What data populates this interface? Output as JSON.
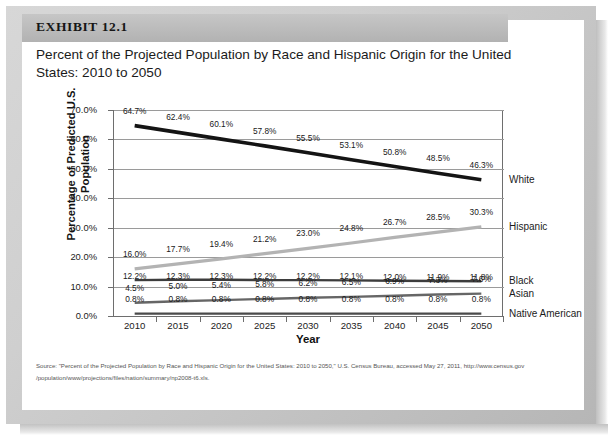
{
  "exhibit": {
    "label": "EXHIBIT 12.1",
    "title": "Percent of the Projected Population by Race and Hispanic Origin for the United States: 2010 to 2050"
  },
  "source": {
    "line1": "Source: \"Percent of the Projected Population by Race and Hispanic Origin for the United States:  2010 to 2050,\" U.S. Census Bureau, accessed May 27, 2011, http://www.census.gov",
    "line2": "/population/www/projections/files/nation/summary/np2008-t6.xls."
  },
  "chart_data": {
    "type": "line",
    "title": "Percent of the Projected Population by Race and Hispanic Origin for the United States: 2010 to 2050",
    "xlabel": "Year",
    "ylabel": "Percentage of Predicted U.S. Population",
    "categories": [
      "2010",
      "2015",
      "2020",
      "2025",
      "2030",
      "2035",
      "2040",
      "2045",
      "2050"
    ],
    "ylim": [
      0,
      70
    ],
    "ytick_labels": [
      "0.0%",
      "10.0%",
      "20.0%",
      "30.0%",
      "40.0%",
      "50.0%",
      "60.0%",
      "70.0%"
    ],
    "ytick_values": [
      0,
      10,
      20,
      30,
      40,
      50,
      60,
      70
    ],
    "grid": "horizontal",
    "legend_position": "right-of-line-ends",
    "series": [
      {
        "name": "White",
        "color": "#141414",
        "values": [
          64.7,
          62.4,
          60.1,
          57.8,
          55.5,
          53.1,
          50.8,
          48.5,
          46.3
        ],
        "labels": [
          "64.7%",
          "62.4%",
          "60.1%",
          "57.8%",
          "55.5%",
          "53.1%",
          "50.8%",
          "48.5%",
          "46.3%"
        ]
      },
      {
        "name": "Hispanic",
        "color": "#b3b3b3",
        "values": [
          16.0,
          17.7,
          19.4,
          21.2,
          23.0,
          24.8,
          26.7,
          28.5,
          30.3
        ],
        "labels": [
          "16.0%",
          "17.7%",
          "19.4%",
          "21.2%",
          "23.0%",
          "24.8%",
          "26.7%",
          "28.5%",
          "30.3%"
        ]
      },
      {
        "name": "Black",
        "color": "#3d3d3d",
        "values": [
          12.2,
          12.3,
          12.3,
          12.2,
          12.2,
          12.1,
          12.0,
          11.9,
          11.8
        ],
        "labels": [
          "12.2%",
          "12.3%",
          "12.3%",
          "12.2%",
          "12.2%",
          "12.1%",
          "12.0%",
          "11.9%",
          "11.8%"
        ]
      },
      {
        "name": "Asian",
        "color": "#666666",
        "values": [
          4.5,
          5.0,
          5.4,
          5.8,
          6.2,
          6.5,
          6.9,
          7.3,
          7.6
        ],
        "labels": [
          "4.5%",
          "5.0%",
          "5.4%",
          "5.8%",
          "6.2%",
          "6.5%",
          "6.9%",
          "7.3%",
          "7.6%"
        ]
      },
      {
        "name": "Native American",
        "color": "#4a4a4a",
        "values": [
          0.8,
          0.8,
          0.8,
          0.8,
          0.8,
          0.8,
          0.8,
          0.8,
          0.8
        ],
        "labels": [
          "0.8%",
          "0.8%",
          "0.8%",
          "0.8%",
          "0.8%",
          "0.8%",
          "0.8%",
          "0.8%",
          "0.8%"
        ]
      }
    ]
  }
}
